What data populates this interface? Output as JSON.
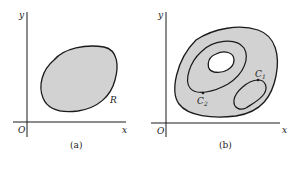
{
  "colors": {
    "region_fill": "#d2d2d2",
    "stroke": "#1a1a1a",
    "background": "#ffffff"
  },
  "panel_a": {
    "caption": "(a)",
    "axis_x_label": "x",
    "axis_y_label": "y",
    "origin_label": "O",
    "region_label": "R"
  },
  "panel_b": {
    "caption": "(b)",
    "axis_x_label": "x",
    "axis_y_label": "y",
    "origin_label": "O",
    "curve_1_label": "C",
    "curve_1_subscript": "1",
    "curve_2_label": "C",
    "curve_2_subscript": "2"
  }
}
